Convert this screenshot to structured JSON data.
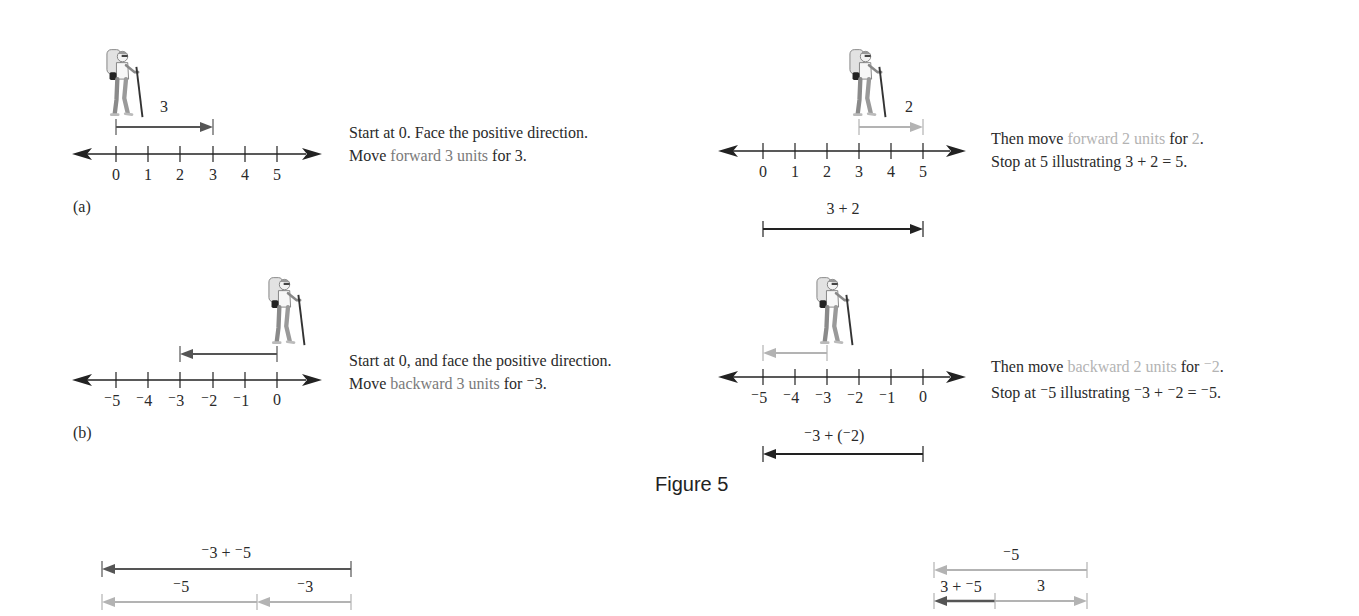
{
  "figure": {
    "title": "Figure 5",
    "panel_a_label": "(a)",
    "panel_b_label": "(b)"
  },
  "colors": {
    "axis": "#222222",
    "dark_arrow": "#555555",
    "black_arrow": "#222222",
    "light_arrow": "#b3b3b3",
    "gray_text": "#7a7a7a",
    "light_text": "#b3b3b3"
  },
  "panel_a_left": {
    "ticks": [
      "0",
      "1",
      "2",
      "3",
      "4",
      "5"
    ],
    "move_label": "3",
    "caption": {
      "line1": "Start at 0. Face the positive direction.",
      "line2_pre": "Move ",
      "line2_highlight": "forward 3 units",
      "line2_post": " for 3."
    }
  },
  "panel_a_right": {
    "ticks": [
      "0",
      "1",
      "2",
      "3",
      "4",
      "5"
    ],
    "move_label": "2",
    "sum_label": "3 + 2",
    "caption": {
      "line1_pre": "Then move ",
      "line1_highlight": "forward 2 units",
      "line1_mid": " for ",
      "line1_highlight2": "2",
      "line1_post": ".",
      "line2": "Stop at 5 illustrating 3 + 2 = 5."
    }
  },
  "panel_b_left": {
    "ticks": [
      "⁻5",
      "⁻4",
      "⁻3",
      "⁻2",
      "⁻1",
      "0"
    ],
    "caption": {
      "line1": "Start at 0, and face the positive direction.",
      "line2_pre": "Move ",
      "line2_highlight": "backward 3 units",
      "line2_post": " for ⁻3."
    }
  },
  "panel_b_right": {
    "ticks": [
      "⁻5",
      "⁻4",
      "⁻3",
      "⁻2",
      "⁻1",
      "0"
    ],
    "sum_label": "⁻3 + (⁻2)",
    "caption": {
      "line1_pre": "Then move ",
      "line1_highlight": "backward 2 units",
      "line1_mid": " for ",
      "line1_highlight2": "⁻2",
      "line1_post": ".",
      "line2": "Stop at ⁻5 illustrating ⁻3 + ⁻2 = ⁻5."
    }
  },
  "bottom_left": {
    "total_label": "⁻3 + ⁻5",
    "seg1_label": "⁻5",
    "seg2_label": "⁻3"
  },
  "bottom_right": {
    "top_label": "⁻5",
    "result_label": "3 + ⁻5",
    "seg_label": "3"
  }
}
